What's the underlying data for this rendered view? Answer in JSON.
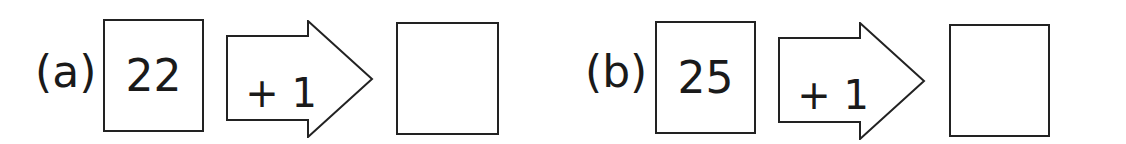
{
  "problems": [
    {
      "label": "(a)",
      "input": "22",
      "operation": "+ 1",
      "answer": ""
    },
    {
      "label": "(b)",
      "input": "25",
      "operation": "+ 1",
      "answer": ""
    }
  ],
  "colors": {
    "stroke": "#222222",
    "background": "#ffffff",
    "text": "#1a1a1a"
  }
}
